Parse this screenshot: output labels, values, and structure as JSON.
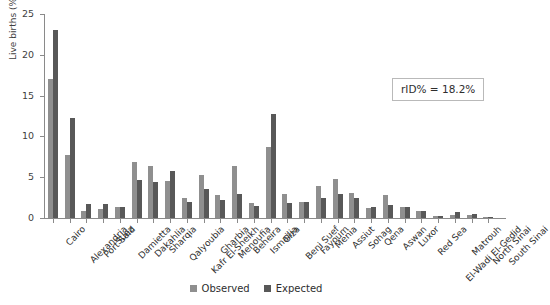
{
  "chart_data": {
    "type": "bar",
    "title": "",
    "subtitle": "",
    "xlabel": "",
    "ylabel": "Live births  (%)",
    "ylim": [
      0,
      25
    ],
    "yticks": [
      0,
      5,
      10,
      15,
      20,
      25
    ],
    "grid": false,
    "legend_position": "bottom-center",
    "categories": [
      "Cairo",
      "Alexandria",
      "Port Said",
      "Suez",
      "Damietta",
      "Dakahlia",
      "Sharqia",
      "Qalyoubia",
      "Kafr El-Sheikh",
      "Gharbia",
      "Menoufia",
      "Beheira",
      "Ismailia",
      "Giza",
      "Beni Suef",
      "Fayoum",
      "Menia",
      "Assiut",
      "Sohag",
      "Qena",
      "Aswan",
      "Luxor",
      "Red Sea",
      "El-Wadi El-Gedid",
      "Matrouh",
      "North Sinai",
      "South Sinai"
    ],
    "series": [
      {
        "name": "Observed",
        "color": "#8f8f8f",
        "values": [
          17.0,
          7.7,
          0.9,
          1.1,
          1.4,
          6.9,
          6.4,
          4.5,
          2.4,
          5.3,
          2.8,
          6.4,
          1.8,
          8.7,
          2.9,
          2.0,
          3.9,
          4.8,
          3.1,
          1.2,
          2.8,
          1.4,
          0.8,
          0.2,
          0.4,
          0.4,
          0.1
        ]
      },
      {
        "name": "Expected",
        "color": "#585858",
        "values": [
          23.1,
          12.2,
          1.7,
          1.7,
          1.4,
          4.7,
          4.4,
          5.8,
          2.0,
          3.6,
          2.2,
          3.0,
          1.5,
          12.8,
          1.8,
          2.0,
          2.5,
          2.9,
          2.5,
          1.4,
          1.6,
          1.3,
          0.8,
          0.2,
          0.7,
          0.5,
          0.1
        ]
      }
    ],
    "annotations": [
      {
        "name": "rid-annotation",
        "text": "rID% = 18.2%"
      }
    ]
  },
  "legend": {
    "items": [
      {
        "label": "Observed",
        "color": "#8f8f8f"
      },
      {
        "label": "Expected",
        "color": "#585858"
      }
    ]
  },
  "annotation_box": {
    "text": "rID% = 18.2%"
  },
  "axes": {
    "y_title": "Live births  (%)",
    "y_tick_labels": [
      "0",
      "5",
      "10",
      "15",
      "20",
      "25"
    ]
  }
}
